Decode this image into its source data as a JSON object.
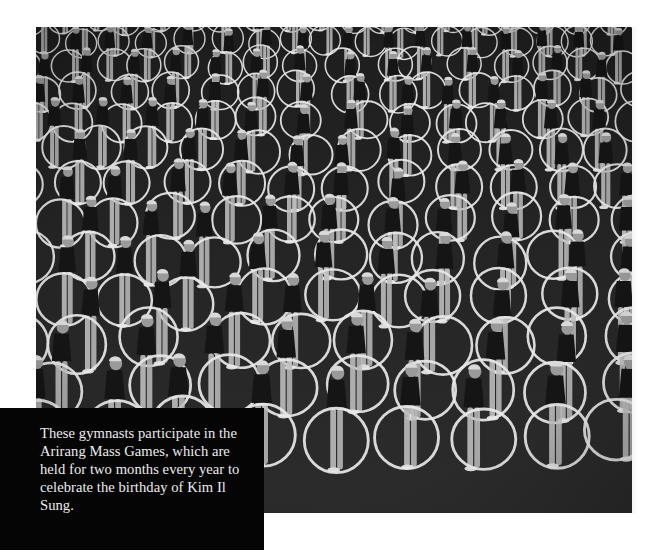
{
  "photo": {
    "description": "Black-and-white photograph of rows of gymnasts holding white hoops",
    "icon": "photo-image",
    "colors": {
      "ground": "#2c2c2c",
      "hoop": "#e8e8e8",
      "skin": "#bdbdbd",
      "costume": "#151515"
    },
    "grid": {
      "rows": 13,
      "top_hoop_diameter": 28,
      "bottom_hoop_diameter": 64
    }
  },
  "caption": {
    "text": "These gymnasts participate in the Arirang Mass Games, which are held for two months every year to celebrate the birthday of Kim Il Sung."
  }
}
